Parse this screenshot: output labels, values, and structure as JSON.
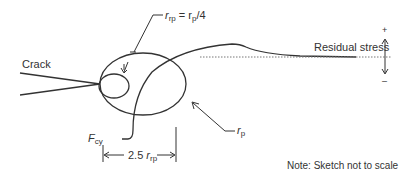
{
  "diagram": {
    "labels": {
      "crack": "Crack",
      "residual_stress": "Residual stress",
      "plus": "+",
      "minus": "–",
      "note": "Note: Sketch not to scale",
      "rrp_eq_r": "r",
      "rrp_eq_sub": "rp",
      "rrp_eq_mid": " = r",
      "rrp_eq_sub2": "p",
      "rrp_eq_end": "/4",
      "rp_r": "r",
      "rp_sub": "p",
      "fcy_f": "F",
      "fcy_sub": "cy",
      "dim_prefix": "2.5 ",
      "dim_r": "r",
      "dim_sub": "rp"
    },
    "colors": {
      "stroke": "#333333",
      "dotted": "#777777",
      "text": "#333333"
    }
  }
}
